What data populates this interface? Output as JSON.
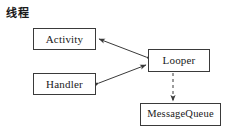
{
  "diagram": {
    "title": "线程",
    "background_color": "#ffffff",
    "stroke_color": "#3a3a3a",
    "text_color": "#1a1a1a",
    "nodes": [
      {
        "id": "activity",
        "label": "Activity"
      },
      {
        "id": "handler",
        "label": "Handler"
      },
      {
        "id": "looper",
        "label": "Looper"
      },
      {
        "id": "queue",
        "label": "MessageQueue"
      }
    ],
    "edges": [
      {
        "from": "looper",
        "to": "activity",
        "style": "solid",
        "arrows": "both"
      },
      {
        "from": "handler",
        "to": "looper",
        "style": "solid",
        "arrows": "both"
      },
      {
        "from": "looper",
        "to": "queue",
        "style": "dashed",
        "arrows": "end"
      }
    ]
  }
}
